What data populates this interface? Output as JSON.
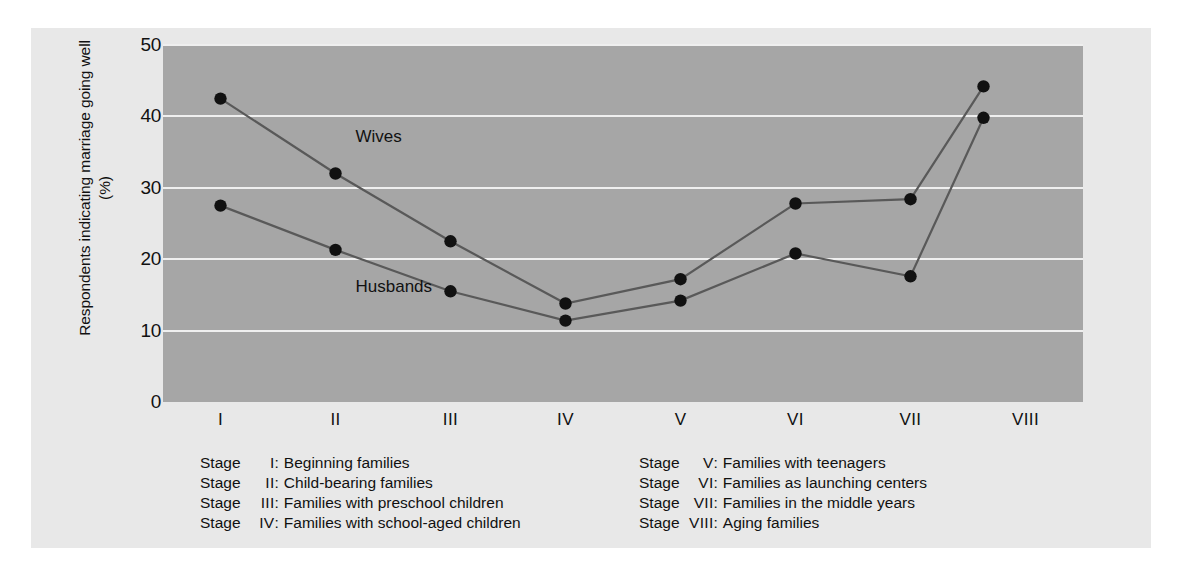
{
  "chart_data": {
    "type": "line",
    "title": "",
    "xlabel": "",
    "ylabel": "Respondents indicating marriage going well (%)",
    "ylim": [
      0,
      50
    ],
    "ytick_values": [
      50,
      40,
      30,
      20,
      10,
      0
    ],
    "ytick_labels": [
      "50",
      "40",
      "30",
      "20",
      "10",
      "0"
    ],
    "categories": [
      "I",
      "II",
      "III",
      "IV",
      "V",
      "VI",
      "VII",
      "VIII"
    ],
    "xtick_labels": [
      "I",
      "II",
      "III",
      "IV",
      "V",
      "VI",
      "VII",
      "VIII"
    ],
    "grid": true,
    "gridlines_at": [
      10,
      20,
      30,
      40,
      50
    ],
    "legend_position": "inline-annotation",
    "series": [
      {
        "name": "Wives",
        "values": [
          42.5,
          32.0,
          22.5,
          13.8,
          17.2,
          27.8,
          28.4,
          44.2
        ]
      },
      {
        "name": "Husbands",
        "values": [
          27.5,
          21.3,
          15.5,
          11.4,
          14.2,
          20.8,
          17.6,
          39.8
        ]
      }
    ],
    "annotations": [
      {
        "text": "Wives",
        "x_category": "II",
        "y_value": 37.0
      },
      {
        "text": "Husbands",
        "x_category": "II",
        "y_value": 16.0
      }
    ]
  },
  "axes": {
    "y_title": "Respondents indicating marriage going well (%)",
    "y_ticks": [
      "50",
      "40",
      "30",
      "20",
      "10",
      "0"
    ],
    "x_ticks": [
      "I",
      "II",
      "III",
      "IV",
      "V",
      "VI",
      "VII",
      "VIII"
    ]
  },
  "series_labels": {
    "wives": "Wives",
    "husbands": "Husbands"
  },
  "legend": {
    "stage_word": "Stage",
    "colon": ":",
    "left_column": [
      {
        "stage": "Stage",
        "roman": "I",
        "description": "Beginning families"
      },
      {
        "stage": "Stage",
        "roman": "II",
        "description": "Child-bearing families"
      },
      {
        "stage": "Stage",
        "roman": "III",
        "description": "Families with preschool children"
      },
      {
        "stage": "Stage",
        "roman": "IV",
        "description": "Families with school-aged children"
      }
    ],
    "right_column": [
      {
        "stage": "Stage",
        "roman": "V",
        "description": "Families with teenagers"
      },
      {
        "stage": "Stage",
        "roman": "VI",
        "description": "Families as launching centers"
      },
      {
        "stage": "Stage",
        "roman": "VII",
        "description": "Families in the middle years"
      },
      {
        "stage": "Stage",
        "roman": "VIII",
        "description": "Aging families"
      }
    ]
  },
  "colors": {
    "figure_background": "#e8e8e8",
    "plot_background": "#a6a6a6",
    "gridline": "#efefef",
    "line": "#595959",
    "marker": "#111111",
    "text": "#111111"
  }
}
